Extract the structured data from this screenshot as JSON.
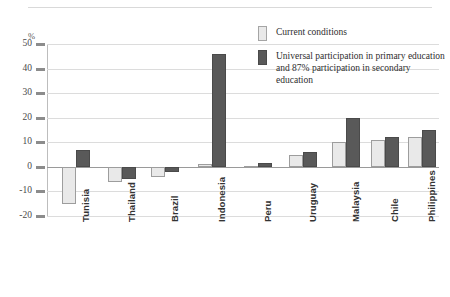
{
  "chart_data": {
    "type": "bar",
    "title": "",
    "subtitle": "",
    "xlabel": "",
    "ylabel": "%",
    "ylim": [
      -20,
      50
    ],
    "ytick_labels": [
      "50",
      "40",
      "30",
      "20",
      "10",
      "0",
      "-10",
      "-20"
    ],
    "ytick_values": [
      50,
      40,
      30,
      20,
      10,
      0,
      -10,
      -20
    ],
    "grid": true,
    "legend_position": "top-right",
    "categories": [
      "Tunisia",
      "Thailand",
      "Brazil",
      "Indonesia",
      "Peru",
      "Uruguay",
      "Malaysia",
      "Chile",
      "Philippines"
    ],
    "series": [
      {
        "name": "Current conditions",
        "color": "#e9e9e9",
        "values": [
          -15,
          -6,
          -4,
          1,
          0.5,
          5,
          10,
          11,
          12
        ]
      },
      {
        "name": "Universal participation in primary education and 87% participation in secondary education",
        "color": "#595959",
        "values": [
          7,
          -5,
          -2,
          46,
          1.5,
          6,
          20,
          12,
          15
        ]
      }
    ]
  },
  "legend": {
    "items": [
      {
        "label": "Current conditions",
        "swatch": "light"
      },
      {
        "label": "Universal participation in primary education and 87% participation in secondary education",
        "swatch": "dark"
      }
    ]
  },
  "axis": {
    "unit_label": "%"
  },
  "colors": {
    "light_bar": "#e9e9e9",
    "dark_bar": "#595959",
    "gridline": "#dcdcdc",
    "zero_line": "#9a9a9a",
    "text": "#333333"
  }
}
